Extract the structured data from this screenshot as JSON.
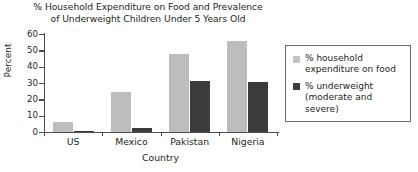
{
  "chart_data": {
    "type": "bar",
    "title": "% Household Expenditure on Food and Prevalence of Underweight Children Under 5 Years Old",
    "title_lines": [
      "% Household Expenditure on Food and Prevalence",
      "of Underweight Children Under 5 Years Old"
    ],
    "xlabel": "Country",
    "ylabel": "Percent",
    "categories": [
      "US",
      "Mexico",
      "Pakistan",
      "Nigeria"
    ],
    "series": [
      {
        "name": "% household expenditure on food",
        "name_lines": [
          "% household",
          "expenditure on food"
        ],
        "color": "#bdbdbd",
        "values": [
          6,
          24.5,
          47.5,
          56
        ]
      },
      {
        "name": "% underweight (moderate and severe)",
        "name_lines": [
          "% underweight",
          "(moderate and",
          "severe)"
        ],
        "color": "#3b3b3b",
        "values": [
          0.5,
          2.5,
          31,
          30.5
        ]
      }
    ],
    "ylim": [
      0,
      60
    ],
    "yticks": [
      0,
      10,
      20,
      30,
      40,
      50,
      60
    ],
    "ytick_labels": [
      "0",
      "10",
      "20",
      "30",
      "40",
      "50",
      "60"
    ],
    "grid": false,
    "legend_position": "right"
  }
}
